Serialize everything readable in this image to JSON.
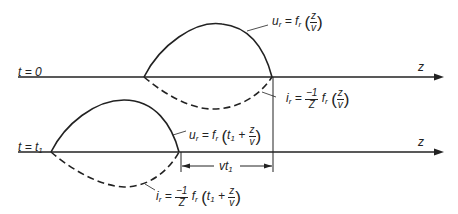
{
  "diagram": {
    "rows": [
      {
        "time_label": "t = 0",
        "axis_label": "z",
        "voltage": {
          "lhs": "u",
          "sub": "r",
          "eq": " = f",
          "fsub": "r",
          "arg_num": "z",
          "arg_den": "v"
        },
        "current": {
          "lhs": "i",
          "sub": "r",
          "eq": " = ",
          "coef_num": "−1",
          "coef_den": "Z",
          "f": " f",
          "fsub": "r",
          "arg_num": "z",
          "arg_den": "v"
        }
      },
      {
        "time_label_t": "t = t",
        "time_label_sub": "1",
        "axis_label": "z",
        "voltage": {
          "lhs": "u",
          "sub": "r",
          "eq": " = f",
          "fsub": "r",
          "arg_pre": "t",
          "arg_pre_sub": "1",
          "plus": " + ",
          "arg_num": "z",
          "arg_den": "v"
        },
        "current": {
          "lhs": "i",
          "sub": "r",
          "eq": " = ",
          "coef_num": "−1",
          "coef_den": "Z",
          "f": " f",
          "fsub": "r",
          "arg_pre": "t",
          "arg_pre_sub": "1",
          "plus": " + ",
          "arg_num": "z",
          "arg_den": "v"
        },
        "displacement": {
          "label": "vt",
          "sub": "1"
        }
      }
    ]
  }
}
